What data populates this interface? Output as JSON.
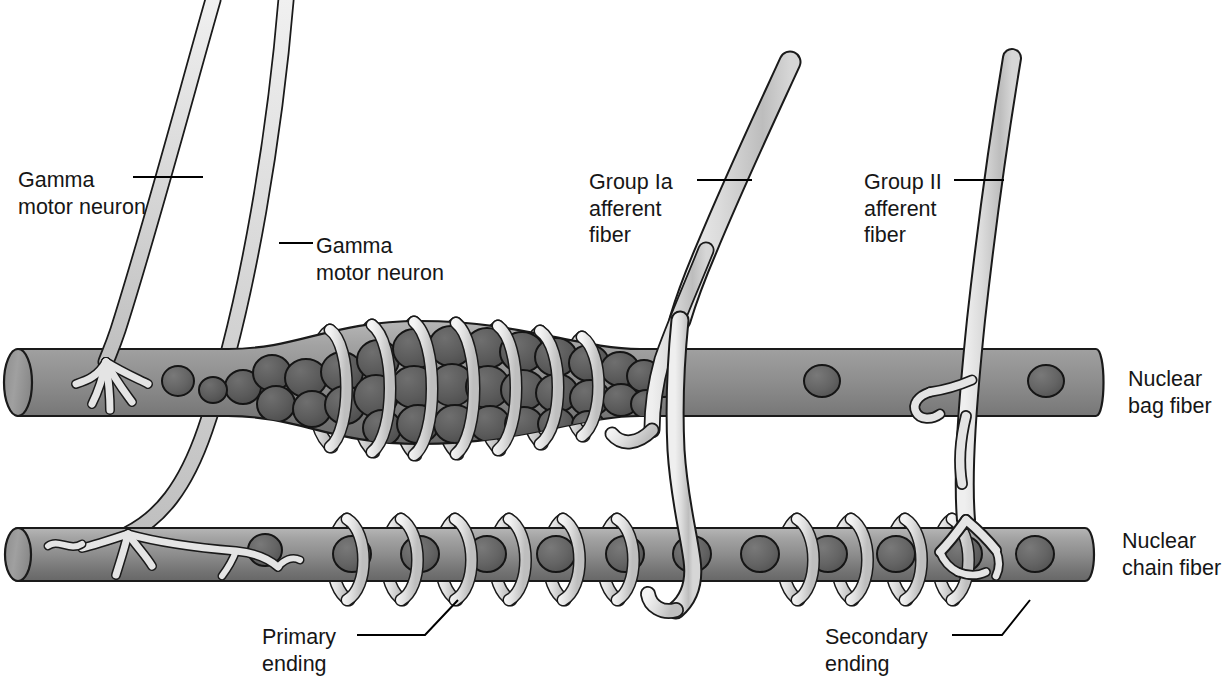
{
  "figure": {
    "background": "#ffffff",
    "text_color": "#161616",
    "leader_line_color": "#000000"
  },
  "palette": {
    "fiber_light": "#b0b0b0",
    "fiber_mid": "#8f8f8f",
    "fiber_dark": "#6e6e6e",
    "fiber_outline": "#1a1a1a",
    "nucleus_fill": "#636363",
    "nucleus_bag_fill": "#5a5a5a",
    "nucleus_outline": "#151515",
    "nerve_light": "#e2e2e2",
    "nerve_mid": "#c9c9c9",
    "nerve_outline": "#1a1a1a",
    "coil_light": "#ededed",
    "coil_mid": "#c4c4c4"
  },
  "labels": [
    {
      "id": "gamma-motor-neuron-1",
      "lines": [
        "Gamma",
        "motor neuron"
      ],
      "x": 18,
      "y": 167,
      "align": "left"
    },
    {
      "id": "gamma-motor-neuron-2",
      "lines": [
        "Gamma",
        "motor neuron"
      ],
      "x": 316,
      "y": 233,
      "align": "left"
    },
    {
      "id": "group-ia-afferent-fiber",
      "lines": [
        "Group Ia",
        "afferent",
        "fiber"
      ],
      "x": 589,
      "y": 169,
      "align": "left"
    },
    {
      "id": "group-ii-afferent-fiber",
      "lines": [
        "Group II",
        "afferent",
        "fiber"
      ],
      "x": 864,
      "y": 169,
      "align": "left"
    },
    {
      "id": "nuclear-bag-fiber",
      "lines": [
        "Nuclear",
        "bag fiber"
      ],
      "x": 1128,
      "y": 366,
      "align": "left"
    },
    {
      "id": "nuclear-chain-fiber",
      "lines": [
        "Nuclear",
        "chain fiber"
      ],
      "x": 1122,
      "y": 528,
      "align": "left"
    },
    {
      "id": "primary-ending",
      "lines": [
        "Primary",
        "ending"
      ],
      "x": 262,
      "y": 624,
      "align": "left"
    },
    {
      "id": "secondary-ending",
      "lines": [
        "Secondary",
        "ending"
      ],
      "x": 825,
      "y": 624,
      "align": "left"
    }
  ],
  "leader_lines": [
    {
      "id": "leader-gamma-1",
      "points": "133,177 203,177"
    },
    {
      "id": "leader-gamma-2",
      "points": "279,243 313,243"
    },
    {
      "id": "leader-group-ia",
      "points": "697,180 752,180"
    },
    {
      "id": "leader-group-ii",
      "points": "954,180 1004,180"
    },
    {
      "id": "leader-primary",
      "points": "357,635 425,635 458,600"
    },
    {
      "id": "leader-secondary",
      "points": "952,635 1002,635 1030,600"
    }
  ],
  "structures": {
    "nuclear_bag_fiber": {
      "name": "Nuclear bag fiber",
      "x_start": 8,
      "x_end": 1106,
      "y_top": 349,
      "y_bottom": 416,
      "equatorial_bulge": {
        "x_start": 228,
        "x_end": 640,
        "extra_height": 28
      },
      "nuclei_count_in_bag": 46,
      "scattered_nuclei_x": [
        178,
        660,
        820,
        1040
      ]
    },
    "nuclear_chain_fiber": {
      "name": "Nuclear chain fiber",
      "x_start": 8,
      "x_end": 1100,
      "y_top": 528,
      "y_bottom": 581,
      "nuclei_x": [
        352,
        420,
        487,
        556,
        625,
        690,
        758,
        826,
        895,
        962,
        1035
      ]
    },
    "group_ia_afferent_fiber": {
      "name": "Group Ia afferent fiber",
      "description": "Thick afferent entering from top, forks into two branches forming the primary (annulospiral) ending around both fibers"
    },
    "group_ii_afferent_fiber": {
      "name": "Group II afferent fiber",
      "description": "Afferent entering from top right, branches to secondary endings on bag and chain fibers"
    },
    "gamma_motor_neuron_1": {
      "name": "Gamma motor neuron",
      "description": "Descends from upper left, ends in a branched motor endplate on the nuclear bag fiber"
    },
    "gamma_motor_neuron_2": {
      "name": "Gamma motor neuron",
      "description": "Descends from upper left, crosses the bag fiber and ends in a trail ending on the nuclear chain fiber"
    },
    "primary_ending": {
      "name": "Primary ending",
      "description": "Annulospiral coils wrapped around the equatorial region of bag and chain fibers"
    },
    "secondary_ending": {
      "name": "Secondary ending",
      "description": "Coils and terminals of the group II fiber juxtaequatorial to the primary ending"
    },
    "spiral_coils_bag_x": [
      330,
      372,
      414,
      456,
      498,
      540,
      582,
      615
    ],
    "spiral_coils_chain_x": [
      345,
      399,
      453,
      507,
      561,
      615
    ],
    "spiral_coils_chain_right_x": [
      795,
      849,
      903,
      950
    ]
  }
}
